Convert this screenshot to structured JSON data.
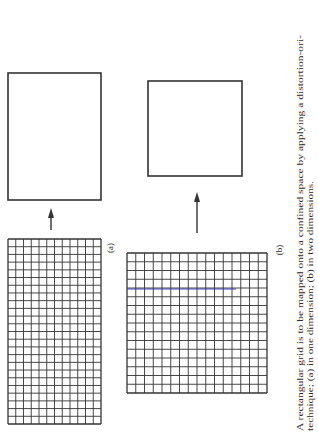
{
  "figure": {
    "panel_a": {
      "label": "(a)",
      "grid": {
        "x": 8,
        "y": 239,
        "width": 93,
        "height": 185,
        "cols": 12,
        "rows": 24
      },
      "target_rect": {
        "x": 8,
        "y": 73,
        "width": 93,
        "height": 127
      },
      "arrow": {
        "x": 51,
        "y_start": 230,
        "y_tip": 208
      }
    },
    "panel_b": {
      "label": "(b)",
      "grid": {
        "x": 127,
        "y": 253,
        "width": 140,
        "height": 140,
        "cols": 16,
        "rows": 16
      },
      "highlight_line": {
        "y": 289,
        "x_start": 127,
        "x_end": 236,
        "color": "#3b3bb5"
      },
      "target_rect": {
        "x": 148,
        "y": 81,
        "width": 94,
        "height": 95
      },
      "arrow": {
        "x": 197,
        "y_start": 233,
        "y_tip": 192
      }
    },
    "caption": {
      "line1": "A rectangular grid is to be mapped onto a confined space by applying a distortion-ori-",
      "line2": "technique; (a) in one dimension; (b) in two dimensions."
    },
    "colors": {
      "line": "#333333",
      "text": "#2a2a2a",
      "highlight": "#3b3bb5"
    }
  }
}
